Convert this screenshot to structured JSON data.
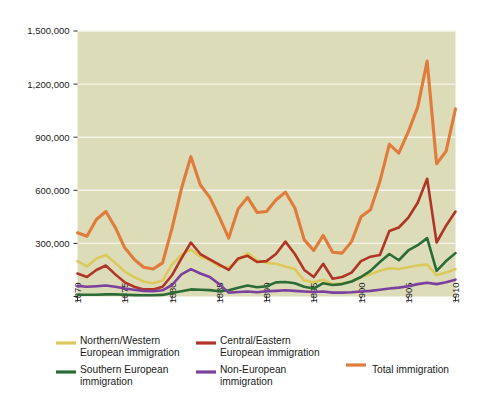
{
  "chart_data": {
    "type": "line",
    "title": "",
    "subtitle": "",
    "xlabel": "",
    "ylabel": "",
    "xlim": [
      1870,
      1910
    ],
    "ylim": [
      0,
      1500000
    ],
    "grid": true,
    "legend_position": "bottom",
    "plot_background": "#dcdcb9",
    "x": [
      1870,
      1871,
      1872,
      1873,
      1874,
      1875,
      1876,
      1877,
      1878,
      1879,
      1880,
      1881,
      1882,
      1883,
      1884,
      1885,
      1886,
      1887,
      1888,
      1889,
      1890,
      1891,
      1892,
      1893,
      1894,
      1895,
      1896,
      1897,
      1898,
      1899,
      1900,
      1901,
      1902,
      1903,
      1904,
      1905,
      1906,
      1907,
      1908,
      1909,
      1910
    ],
    "xticks": [
      1870,
      1875,
      1880,
      1885,
      1890,
      1895,
      1900,
      1905,
      1910
    ],
    "xtick_labels": [
      "1870",
      "1875",
      "1880",
      "1885",
      "1890",
      "1895",
      "1900",
      "1905",
      "1910"
    ],
    "yticks": [
      0,
      300000,
      600000,
      900000,
      1200000,
      1500000
    ],
    "ytick_labels": [
      "",
      "300,000",
      "600,000",
      "900,000",
      "1,200,000",
      "1,500,000"
    ],
    "series": [
      {
        "name": "Northern/Western European immigration",
        "key": "northern_western",
        "color": "#ddc85b",
        "values": [
          200000,
          170000,
          215000,
          235000,
          190000,
          140000,
          110000,
          85000,
          75000,
          90000,
          180000,
          235000,
          265000,
          225000,
          205000,
          170000,
          165000,
          205000,
          245000,
          205000,
          190000,
          185000,
          170000,
          155000,
          90000,
          80000,
          95000,
          70000,
          75000,
          85000,
          110000,
          125000,
          145000,
          160000,
          155000,
          165000,
          175000,
          180000,
          120000,
          135000,
          155000
        ]
      },
      {
        "name": "Central/Eastern European immigration",
        "key": "central_eastern",
        "color": "#b03527",
        "values": [
          130000,
          110000,
          150000,
          175000,
          125000,
          80000,
          55000,
          40000,
          40000,
          55000,
          120000,
          215000,
          305000,
          240000,
          210000,
          180000,
          150000,
          215000,
          230000,
          195000,
          200000,
          240000,
          310000,
          240000,
          150000,
          110000,
          185000,
          100000,
          110000,
          135000,
          200000,
          225000,
          235000,
          370000,
          390000,
          445000,
          530000,
          665000,
          305000,
          400000,
          480000
        ]
      },
      {
        "name": "Southern European immigration",
        "key": "southern",
        "color": "#2b6b35",
        "values": [
          10000,
          10000,
          10000,
          12000,
          12000,
          10000,
          8000,
          7000,
          7000,
          9000,
          20000,
          30000,
          40000,
          38000,
          36000,
          30000,
          35000,
          50000,
          62000,
          52000,
          58000,
          80000,
          82000,
          75000,
          55000,
          45000,
          75000,
          65000,
          70000,
          85000,
          110000,
          145000,
          195000,
          240000,
          205000,
          260000,
          290000,
          330000,
          145000,
          200000,
          245000
        ]
      },
      {
        "name": "Non-European immigration",
        "key": "non_european",
        "color": "#7b3f9e",
        "values": [
          60000,
          55000,
          58000,
          62000,
          55000,
          45000,
          38000,
          32000,
          30000,
          35000,
          65000,
          125000,
          155000,
          130000,
          110000,
          70000,
          22000,
          25000,
          28000,
          24000,
          30000,
          32000,
          35000,
          32000,
          28000,
          25000,
          28000,
          22000,
          22000,
          24000,
          28000,
          32000,
          38000,
          45000,
          50000,
          58000,
          70000,
          78000,
          70000,
          80000,
          95000
        ]
      },
      {
        "name": "Total immigration",
        "key": "total",
        "color": "#e07b3c",
        "values": [
          360000,
          340000,
          435000,
          480000,
          390000,
          275000,
          210000,
          165000,
          155000,
          190000,
          385000,
          610000,
          790000,
          630000,
          560000,
          450000,
          330000,
          495000,
          560000,
          475000,
          480000,
          545000,
          590000,
          500000,
          320000,
          260000,
          345000,
          250000,
          245000,
          310000,
          450000,
          490000,
          650000,
          860000,
          810000,
          930000,
          1070000,
          1330000,
          750000,
          820000,
          1060000
        ]
      }
    ]
  },
  "legend": {
    "entries": [
      {
        "label_line1": "Northern/Western",
        "label_line2": "European immigration",
        "color": "#ddc85b",
        "name": "legend-northern-western"
      },
      {
        "label_line1": "Central/Eastern",
        "label_line2": "European immigration",
        "color": "#b03527",
        "name": "legend-central-eastern"
      },
      {
        "label_line1": "Southern European",
        "label_line2": "immigration",
        "color": "#2b6b35",
        "name": "legend-southern"
      },
      {
        "label_line1": "Non-European",
        "label_line2": "immigration",
        "color": "#7b3f9e",
        "name": "legend-non-european"
      },
      {
        "label_line1": "Total immigration",
        "label_line2": "",
        "color": "#e07b3c",
        "name": "legend-total"
      }
    ]
  }
}
